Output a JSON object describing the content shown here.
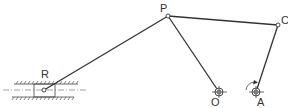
{
  "diagram": {
    "type": "linkage-mechanism",
    "joints": {
      "P": {
        "label": "P",
        "x": 168,
        "y": 16
      },
      "C": {
        "label": "C",
        "x": 278,
        "y": 25
      },
      "O": {
        "label": "O",
        "x": 219,
        "y": 92
      },
      "A": {
        "label": "A",
        "x": 256,
        "y": 92
      },
      "R": {
        "label": "R",
        "x": 44,
        "y": 90
      }
    },
    "links": [
      {
        "from": "R",
        "to": "P"
      },
      {
        "from": "P",
        "to": "O"
      },
      {
        "from": "P",
        "to": "C"
      },
      {
        "from": "C",
        "to": "A"
      }
    ],
    "rotation_indicator": {
      "at": "A",
      "direction": "counterclockwise"
    }
  }
}
